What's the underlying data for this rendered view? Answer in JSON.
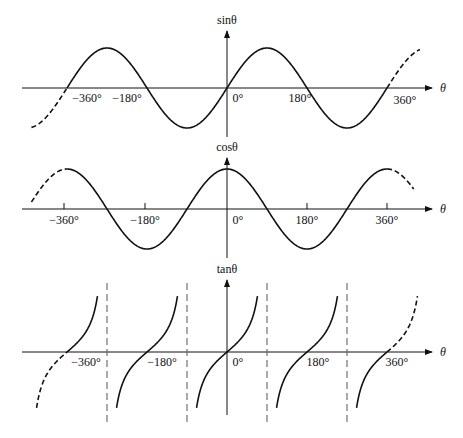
{
  "chart_data": [
    {
      "type": "line",
      "title": "sinθ",
      "ylabel": "sinθ",
      "xlabel": "θ",
      "function": "sin",
      "x_range_deg": [
        -440,
        440
      ],
      "xticks": [
        -360,
        -180,
        0,
        180,
        360
      ],
      "xtick_labels": [
        "−360°",
        "−180°",
        "0°",
        "180°",
        "360°"
      ],
      "dashed_segments_deg": [
        [
          -440,
          -360
        ],
        [
          360,
          435
        ]
      ],
      "ylim": [
        -1,
        1
      ],
      "grid": false
    },
    {
      "type": "line",
      "title": "cosθ",
      "ylabel": "cosθ",
      "xlabel": "θ",
      "function": "cos",
      "x_range_deg": [
        -440,
        440
      ],
      "xticks": [
        -360,
        -180,
        0,
        180,
        360
      ],
      "xtick_labels": [
        "−360°",
        "−180°",
        "0°",
        "180°",
        "360°"
      ],
      "dashed_segments_deg": [
        [
          -440,
          -360
        ],
        [
          360,
          420
        ]
      ],
      "ylim": [
        -1,
        1
      ],
      "grid": false
    },
    {
      "type": "line",
      "title": "tanθ",
      "ylabel": "tanθ",
      "xlabel": "θ",
      "function": "tan",
      "x_range_deg": [
        -440,
        440
      ],
      "xticks": [
        -360,
        -180,
        0,
        180,
        360
      ],
      "xtick_labels": [
        "−360°",
        "−180°",
        "0°",
        "180°",
        "360°"
      ],
      "asymptotes_deg": [
        -270,
        -90,
        90,
        270
      ],
      "dashed_segments_deg": [
        [
          -440,
          -360
        ],
        [
          360,
          430
        ]
      ],
      "grid": false
    }
  ],
  "labels": {
    "sin_axis": "sinθ",
    "cos_axis": "cosθ",
    "tan_axis": "tanθ",
    "theta": "θ",
    "ticks": [
      "−360°",
      "−180°",
      "0°",
      "180°",
      "360°"
    ]
  }
}
